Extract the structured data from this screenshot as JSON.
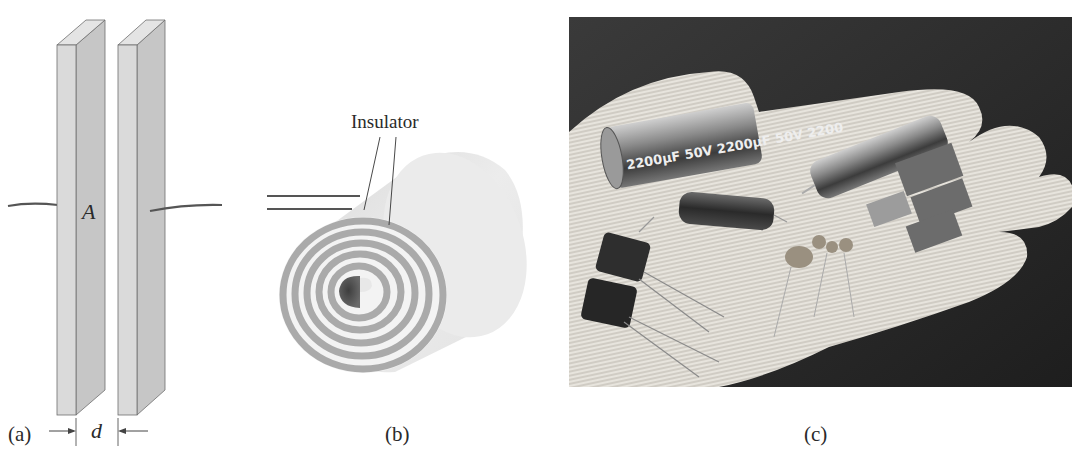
{
  "figure": {
    "panels": [
      {
        "id": "a",
        "caption": "(a)",
        "description": "Parallel-plate capacitor",
        "labels": {
          "area": "A",
          "separation": "d"
        }
      },
      {
        "id": "b",
        "caption": "(b)",
        "description": "Rolled (spiral) capacitor",
        "labels": {
          "insulator": "Insulator"
        }
      },
      {
        "id": "c",
        "caption": "(c)",
        "description": "Photograph of assorted capacitors on a gloved hand",
        "photo_text": {
          "capacitor_marking": "2200µF 50V 2200µF 50V 2200"
        }
      }
    ]
  },
  "colors": {
    "plate_front": "#d9d9d9",
    "plate_side": "#c4c4c4",
    "plate_top": "#e4e4e4",
    "outline": "#6e6e6e",
    "wire": "#555555",
    "spiral_conductor": "#a9a9a9",
    "spiral_insulator": "#f2f2f2",
    "spiral_core": "#4a4a4a",
    "photo_background": "#2b2b2b",
    "glove": "#e6e3dc"
  }
}
